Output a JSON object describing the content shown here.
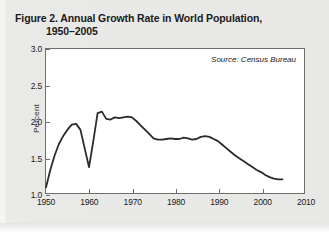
{
  "figure": {
    "title_line1": "Figure 2. Annual Growth Rate in World Population,",
    "title_line2": "1950–2005",
    "source_note": "Source: Census Bureau"
  },
  "chart_data": {
    "type": "line",
    "title": "Figure 2. Annual Growth Rate in World Population, 1950–2005",
    "xlabel": "",
    "ylabel": "Percent",
    "xlim": [
      1950,
      2010
    ],
    "ylim": [
      1.0,
      3.0
    ],
    "xticks": [
      1950,
      1960,
      1970,
      1980,
      1990,
      2000,
      2010
    ],
    "xtick_labels": [
      "1950",
      "1960",
      "1970",
      "1980",
      "1990",
      "2000",
      "2010"
    ],
    "yticks": [
      1.0,
      1.5,
      2.0,
      2.5,
      3.0
    ],
    "ytick_labels": [
      "1.0",
      "1.5",
      "2.0",
      "2.5",
      "3.0"
    ],
    "grid": false,
    "legend": false,
    "line_color": "#2b2b2b",
    "line_width": 1.8,
    "annotations": [
      {
        "text": "Source: Census Bureau",
        "position": "top-right",
        "italic": true
      }
    ],
    "series": [
      {
        "name": "Annual growth rate of world population",
        "units": "percent",
        "x": [
          1950,
          1951,
          1952,
          1953,
          1954,
          1955,
          1956,
          1957,
          1958,
          1959,
          1960,
          1961,
          1962,
          1963,
          1964,
          1965,
          1966,
          1967,
          1968,
          1969,
          1970,
          1971,
          1972,
          1973,
          1974,
          1975,
          1976,
          1977,
          1978,
          1979,
          1980,
          1981,
          1982,
          1983,
          1984,
          1985,
          1986,
          1987,
          1988,
          1989,
          1990,
          1991,
          1992,
          1993,
          1994,
          1995,
          1996,
          1997,
          1998,
          1999,
          2000,
          2001,
          2002,
          2003,
          2004,
          2005
        ],
        "values": [
          1.08,
          1.32,
          1.52,
          1.68,
          1.79,
          1.88,
          1.95,
          1.96,
          1.88,
          1.62,
          1.36,
          1.72,
          2.11,
          2.13,
          2.03,
          2.02,
          2.05,
          2.04,
          2.05,
          2.06,
          2.05,
          2.0,
          1.94,
          1.88,
          1.82,
          1.76,
          1.74,
          1.74,
          1.75,
          1.76,
          1.75,
          1.75,
          1.77,
          1.76,
          1.74,
          1.75,
          1.78,
          1.79,
          1.78,
          1.75,
          1.72,
          1.67,
          1.62,
          1.57,
          1.52,
          1.48,
          1.44,
          1.4,
          1.36,
          1.32,
          1.29,
          1.25,
          1.22,
          1.2,
          1.19,
          1.19
        ]
      }
    ]
  }
}
